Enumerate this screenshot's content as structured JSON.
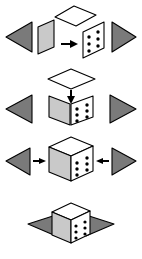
{
  "figure": {
    "background_color": "#ffffff",
    "panel_count": 4,
    "width": 142,
    "height": 259
  },
  "colors": {
    "outline": "#000000",
    "triangle_fill": "#7a7a7a",
    "face_light_gray": "#c9c9c9",
    "face_mid_gray": "#b3b3b3",
    "face_white": "#ffffff",
    "dot_fill": "#000000",
    "arrow_fill": "#000000",
    "background": "#ffffff"
  },
  "shapes": {
    "die_face_dots": 6,
    "dot_columns": 2,
    "dot_rows": 3,
    "triangle_label_left": "left-pointing triangle",
    "triangle_label_right": "right-pointing triangle",
    "rhombus_label": "white rhombus top face"
  },
  "panels": [
    {
      "id": "panel-1",
      "name": "step-1-flat-faces",
      "caption": "Flat faces separated, arrow points right",
      "elements": [
        {
          "name": "left-triangle",
          "kind": "triangle",
          "direction": "left",
          "fill": "#7a7a7a"
        },
        {
          "name": "gray-face-panel",
          "kind": "parallelogram",
          "fill": "#c9c9c9"
        },
        {
          "name": "white-rhombus-top",
          "kind": "rhombus",
          "fill": "#ffffff"
        },
        {
          "name": "right-arrow",
          "kind": "arrow",
          "direction": "right",
          "fill": "#000000"
        },
        {
          "name": "dotted-face-panel",
          "kind": "parallelogram",
          "fill": "#ffffff",
          "dots": 6
        },
        {
          "name": "right-triangle",
          "kind": "triangle",
          "direction": "right",
          "fill": "#7a7a7a"
        }
      ]
    },
    {
      "id": "panel-2",
      "name": "step-2-folding",
      "caption": "Two faces folded into a V, top rhombus descending",
      "elements": [
        {
          "name": "white-rhombus-top",
          "kind": "rhombus",
          "fill": "#ffffff"
        },
        {
          "name": "down-arrow",
          "kind": "arrow",
          "direction": "down",
          "fill": "#000000"
        },
        {
          "name": "left-triangle",
          "kind": "triangle",
          "direction": "left",
          "fill": "#7a7a7a"
        },
        {
          "name": "gray-face-panel",
          "kind": "parallelogram",
          "fill": "#c9c9c9"
        },
        {
          "name": "dotted-face-panel",
          "kind": "parallelogram",
          "fill": "#ffffff",
          "dots": 6
        },
        {
          "name": "right-triangle",
          "kind": "triangle",
          "direction": "right",
          "fill": "#7a7a7a"
        }
      ]
    },
    {
      "id": "panel-3",
      "name": "step-3-assembled-cube",
      "caption": "Completed cube with triangles converging inward",
      "elements": [
        {
          "name": "left-triangle",
          "kind": "triangle",
          "direction": "left",
          "fill": "#7a7a7a"
        },
        {
          "name": "right-arrow",
          "kind": "arrow",
          "direction": "right",
          "fill": "#000000"
        },
        {
          "name": "cube-top-face",
          "kind": "rhombus",
          "fill": "#ffffff"
        },
        {
          "name": "cube-left-face",
          "kind": "parallelogram",
          "fill": "#c9c9c9"
        },
        {
          "name": "cube-right-face",
          "kind": "parallelogram",
          "fill": "#ffffff",
          "dots": 6
        },
        {
          "name": "left-arrow",
          "kind": "arrow",
          "direction": "left",
          "fill": "#000000"
        },
        {
          "name": "right-triangle",
          "kind": "triangle",
          "direction": "right",
          "fill": "#7a7a7a"
        }
      ]
    },
    {
      "id": "panel-4",
      "name": "step-4-triangles-flattened",
      "caption": "Triangles flattened against the cube base",
      "elements": [
        {
          "name": "left-flat-triangle",
          "kind": "triangle",
          "direction": "left",
          "fill": "#7a7a7a"
        },
        {
          "name": "right-flat-triangle",
          "kind": "triangle",
          "direction": "right",
          "fill": "#7a7a7a"
        },
        {
          "name": "cube-top-face",
          "kind": "rhombus",
          "fill": "#ffffff"
        },
        {
          "name": "cube-left-face",
          "kind": "parallelogram",
          "fill": "#c9c9c9"
        },
        {
          "name": "cube-right-face",
          "kind": "parallelogram",
          "fill": "#ffffff",
          "dots": 6
        }
      ]
    }
  ]
}
